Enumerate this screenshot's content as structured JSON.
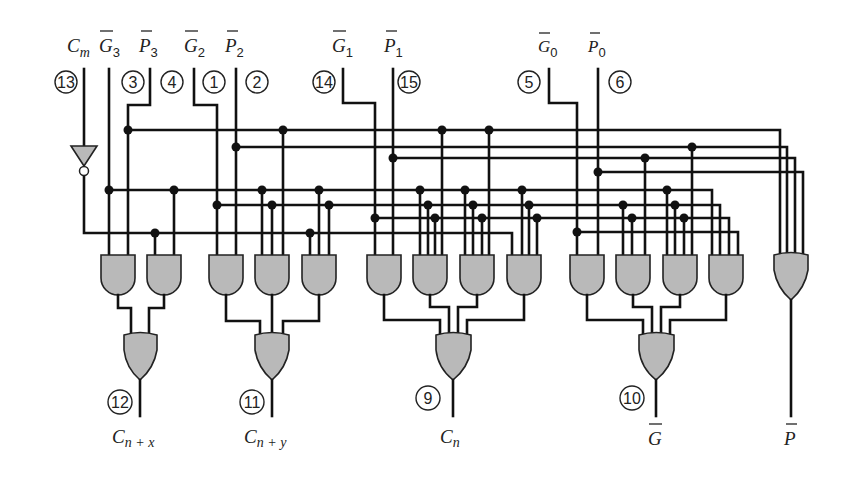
{
  "diagram": {
    "inputs": [
      {
        "id": "cm",
        "label": "C",
        "sub": "m",
        "overbar": false,
        "pin": "13"
      },
      {
        "id": "g3",
        "label": "G",
        "sub": "3",
        "overbar": true,
        "pin": "3"
      },
      {
        "id": "p3",
        "label": "P",
        "sub": "3",
        "overbar": true,
        "pin": "4"
      },
      {
        "id": "g2",
        "label": "G",
        "sub": "2",
        "overbar": true,
        "pin": "1"
      },
      {
        "id": "p2",
        "label": "P",
        "sub": "2",
        "overbar": true,
        "pin": "2"
      },
      {
        "id": "g1",
        "label": "G",
        "sub": "1",
        "overbar": true,
        "pin": "14"
      },
      {
        "id": "p1",
        "label": "P",
        "sub": "1",
        "overbar": true,
        "pin": "15"
      },
      {
        "id": "g0",
        "label": "G",
        "sub": "0",
        "overbar": true,
        "pin": "5"
      },
      {
        "id": "p0",
        "label": "P",
        "sub": "0",
        "overbar": true,
        "pin": "6"
      }
    ],
    "outputs": [
      {
        "id": "cnx",
        "label": "C",
        "sub": "n + x",
        "overbar": false,
        "pin": "12"
      },
      {
        "id": "cny",
        "label": "C",
        "sub": "n + y",
        "overbar": false,
        "pin": "11"
      },
      {
        "id": "cnz",
        "label": "C",
        "sub": "n",
        "overbar": false,
        "pin": "9"
      },
      {
        "id": "g",
        "label": "G",
        "sub": "",
        "overbar": true,
        "pin": "10"
      },
      {
        "id": "p",
        "label": "P",
        "sub": "",
        "overbar": true,
        "pin": ""
      }
    ],
    "gates": {
      "inverter": 1,
      "and_gates": 13,
      "or_gates": 5
    },
    "colors": {
      "wire": "#111111",
      "gate_fill": "#b9b9b9",
      "background": "#ffffff"
    }
  }
}
